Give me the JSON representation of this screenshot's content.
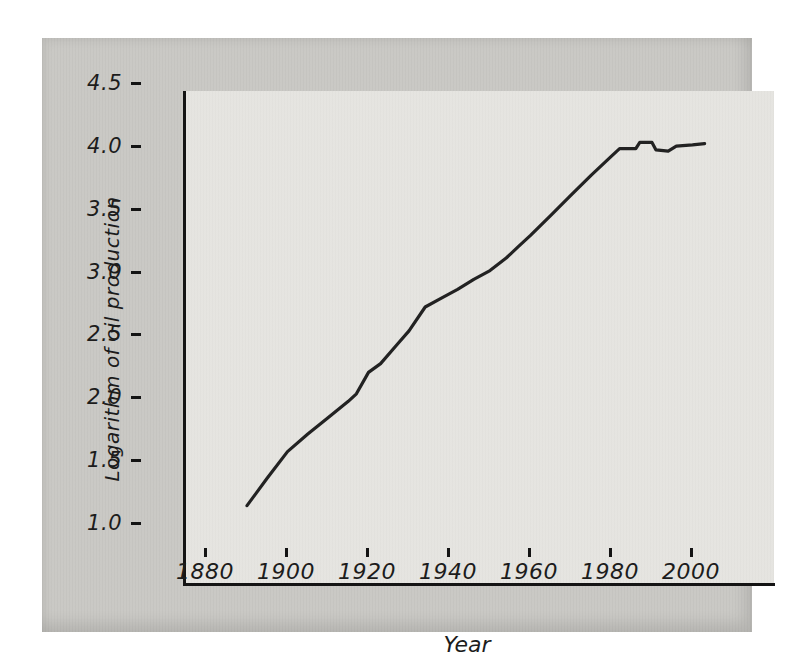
{
  "figure": {
    "page_background": "#ffffff",
    "panel_color": "#c9c8c4",
    "plot_background": "#e5e4e0",
    "axis_color": "#141414",
    "line_color": "#222222",
    "text_color": "#1c1c1c"
  },
  "chart_data": {
    "type": "line",
    "title": "",
    "xlabel": "Year",
    "ylabel": "Logarithm of oil production",
    "xlim": [
      1865,
      2010
    ],
    "ylim": [
      0.82,
      4.71
    ],
    "grid": false,
    "legend_position": "none",
    "x_tick_labels": [
      "1880",
      "1900",
      "1920",
      "1940",
      "1960",
      "1980",
      "2000"
    ],
    "y_tick_labels": [
      "4.5",
      "4.0",
      "3.5",
      "3.0",
      "2.5",
      "2.0",
      "1.5",
      "1.0"
    ],
    "series": [
      {
        "name": "Logarithm of oil production",
        "points": [
          [
            1880,
            1.44
          ],
          [
            1885,
            1.66
          ],
          [
            1890,
            1.87
          ],
          [
            1895,
            2.01
          ],
          [
            1900,
            2.14
          ],
          [
            1905,
            2.27
          ],
          [
            1907,
            2.33
          ],
          [
            1910,
            2.5
          ],
          [
            1913,
            2.57
          ],
          [
            1917,
            2.72
          ],
          [
            1920,
            2.83
          ],
          [
            1924,
            3.02
          ],
          [
            1928,
            3.09
          ],
          [
            1932,
            3.16
          ],
          [
            1936,
            3.24
          ],
          [
            1940,
            3.31
          ],
          [
            1944,
            3.41
          ],
          [
            1947,
            3.5
          ],
          [
            1950,
            3.59
          ],
          [
            1955,
            3.75
          ],
          [
            1960,
            3.91
          ],
          [
            1965,
            4.07
          ],
          [
            1970,
            4.22
          ],
          [
            1972,
            4.28
          ],
          [
            1976,
            4.28
          ],
          [
            1977,
            4.33
          ],
          [
            1980,
            4.33
          ],
          [
            1981,
            4.27
          ],
          [
            1984,
            4.26
          ],
          [
            1986,
            4.3
          ],
          [
            1990,
            4.31
          ],
          [
            1993,
            4.32
          ]
        ]
      }
    ]
  }
}
